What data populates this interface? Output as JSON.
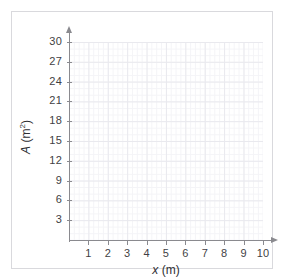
{
  "chart_data": {
    "type": "scatter",
    "title": "",
    "subtitle": "",
    "xlabel_var": "x",
    "xlabel_unit": "(m)",
    "ylabel_var": "A",
    "ylabel_unit": "(m",
    "ylabel_exp": "2",
    "ylabel_close": ")",
    "x_ticks": [
      1,
      2,
      3,
      4,
      5,
      6,
      7,
      8,
      9,
      10
    ],
    "y_ticks": [
      3,
      6,
      9,
      12,
      15,
      18,
      21,
      24,
      27,
      30
    ],
    "xlim": [
      0,
      10
    ],
    "ylim": [
      0,
      30
    ],
    "x_major_step": 1,
    "y_major_step": 3,
    "x_minor_per_major": 4,
    "y_minor_per_major": 3,
    "grid": true,
    "legend": "none",
    "series": [],
    "values": [],
    "annotations": []
  },
  "axes": {
    "x_tick_labels": [
      "1",
      "2",
      "3",
      "4",
      "5",
      "6",
      "7",
      "8",
      "9",
      "10"
    ],
    "y_tick_labels": [
      "3",
      "6",
      "9",
      "12",
      "15",
      "18",
      "21",
      "24",
      "27",
      "30"
    ]
  },
  "colors": {
    "frame": "#d9d9dd",
    "axis": "#8a8a8f",
    "grid_major": "#e9e9ee",
    "grid_minor": "#f4f4f7",
    "text": "#3f3f44",
    "background": "#ffffff"
  }
}
